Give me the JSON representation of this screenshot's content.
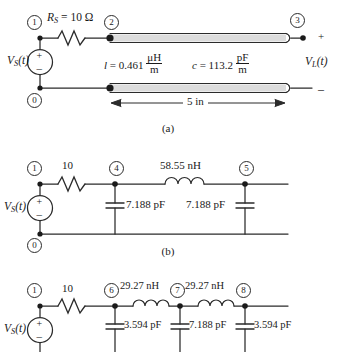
{
  "figure": {
    "captions": {
      "a": "(a)",
      "b": "(b)",
      "c": "(c)"
    }
  },
  "circuit_a": {
    "source_label": "V",
    "source_sub": "S",
    "source_arg": "(t)",
    "source_plus": "+",
    "source_minus": "–",
    "resistor": {
      "name": "R",
      "sub": "S",
      "eq": " = 10 Ω"
    },
    "line_inductance": {
      "sym": "l",
      "eq": " = 0.461 ",
      "num": "μH",
      "den": "m"
    },
    "line_capacitance": {
      "sym": "c",
      "eq": " = 113.2 ",
      "num": "pF",
      "den": "m"
    },
    "length": "5 in",
    "load_plus": "+",
    "load_minus": "–",
    "load_label": "V",
    "load_sub": "L",
    "load_arg": "(t)",
    "nodes": [
      "1",
      "2",
      "3",
      "0"
    ]
  },
  "circuit_b": {
    "source_label": "V",
    "source_sub": "S",
    "source_arg": "(t)",
    "source_plus": "+",
    "source_minus": "–",
    "resistor": "10",
    "inductor": "58.55 nH",
    "cap_left": "7.188 pF",
    "cap_right": "7.188 pF",
    "nodes": [
      "1",
      "4",
      "5",
      "0"
    ]
  },
  "circuit_c": {
    "source_label": "V",
    "source_sub": "S",
    "source_arg": "(t)",
    "source_plus": "+",
    "source_minus": "–",
    "resistor": "10",
    "inductor_left": "29.27 nH",
    "inductor_right": "29.27 nH",
    "cap_left": "3.594 pF",
    "cap_mid": "7.188 pF",
    "cap_right": "3.594 pF",
    "nodes": [
      "1",
      "6",
      "7",
      "8"
    ]
  },
  "colors": {
    "ink": "#1a1a1a",
    "line": "#2b2b2b",
    "tube": "#d8d8d8"
  }
}
